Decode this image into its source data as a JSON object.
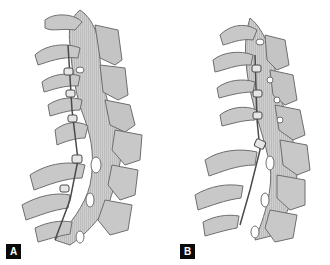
{
  "figure": {
    "panels": [
      {
        "label": "A",
        "description": "Cervical spine lateral view with posterior spinous process wiring/spacer implants, kyphotic deformity at mid-cervical level",
        "implant_count": 5
      },
      {
        "label": "B",
        "description": "Cervical spine lateral view after correction with posterior spacer implants, restored lordotic alignment",
        "implant_count": 4
      }
    ],
    "colors": {
      "background": "#ffffff",
      "bone_fill": "#c8c8c8",
      "bone_outline": "#6e6e6e",
      "bone_shadow": "#9a9a9a",
      "implant": "#4a4a4a",
      "label_bg": "#0a0a0a",
      "label_text": "#ffffff"
    }
  }
}
